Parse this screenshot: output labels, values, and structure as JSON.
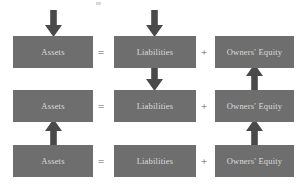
{
  "diagram": {
    "colors": {
      "box_fill": "#6e6e6e",
      "box_text": "#dcdcdc",
      "arrow_fill": "#4a4a4a",
      "operator": "#5a5a5a",
      "background": "#ffffff"
    },
    "columns": [
      {
        "key": "assets",
        "label": "Assets"
      },
      {
        "key": "liabilities",
        "label": "Liabilities"
      },
      {
        "key": "owners_equity",
        "label": "Owners' Equity"
      }
    ],
    "operators": {
      "equals": "=",
      "plus": "+"
    },
    "rows": [
      {
        "row": 1,
        "cells": [
          {
            "label": "Assets"
          },
          {
            "label": "Liabilities"
          },
          {
            "label": "Owners' Equity"
          }
        ]
      },
      {
        "row": 2,
        "cells": [
          {
            "label": "Assets"
          },
          {
            "label": "Liabilities"
          },
          {
            "label": "Owners' Equity"
          }
        ]
      },
      {
        "row": 3,
        "cells": [
          {
            "label": "Assets"
          },
          {
            "label": "Liabilities"
          },
          {
            "label": "Owners' Equity"
          }
        ]
      }
    ],
    "arrows": [
      {
        "id": "a1",
        "column": "assets",
        "direction": "down",
        "position": "above-row-1"
      },
      {
        "id": "a2",
        "column": "liabilities",
        "direction": "down",
        "position": "above-row-1"
      },
      {
        "id": "a3",
        "column": "liabilities",
        "direction": "down",
        "position": "row-1-to-row-2"
      },
      {
        "id": "a4",
        "column": "owners_equity",
        "direction": "up",
        "position": "row-2-to-row-1"
      },
      {
        "id": "a5",
        "column": "assets",
        "direction": "up",
        "position": "row-3-to-row-2"
      },
      {
        "id": "a6",
        "column": "owners_equity",
        "direction": "up",
        "position": "row-3-to-row-2"
      }
    ]
  }
}
